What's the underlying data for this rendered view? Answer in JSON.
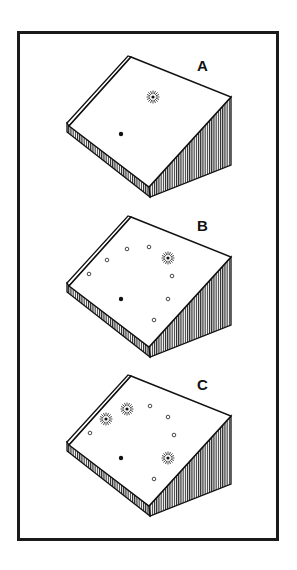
{
  "figure": {
    "frame": {
      "x": 17,
      "y": 31,
      "width": 262,
      "height": 510,
      "stroke": "#1a1a1a"
    },
    "panels": [
      {
        "label": "A",
        "offset_y": 0,
        "stars": [
          [
            153,
            97
          ]
        ],
        "filled_dots": [
          [
            121,
            134
          ]
        ],
        "open_circles": []
      },
      {
        "label": "B",
        "offset_y": 160,
        "stars": [
          [
            168,
            258
          ]
        ],
        "filled_dots": [
          [
            121,
            299
          ]
        ],
        "open_circles": [
          [
            127,
            249
          ],
          [
            149,
            247
          ],
          [
            107,
            260
          ],
          [
            89,
            274
          ],
          [
            172,
            276
          ],
          [
            168,
            299
          ],
          [
            154,
            320
          ]
        ]
      },
      {
        "label": "C",
        "offset_y": 319,
        "stars": [
          [
            127,
            409
          ],
          [
            106,
            419
          ],
          [
            168,
            458
          ]
        ],
        "filled_dots": [
          [
            121,
            458
          ]
        ],
        "open_circles": [
          [
            150,
            406
          ],
          [
            168,
            417
          ],
          [
            90,
            433
          ],
          [
            174,
            435
          ],
          [
            154,
            479
          ]
        ]
      }
    ],
    "legend_semantics": {
      "star-icon": "radiating burst marker",
      "filled-dot": "solid black point",
      "open-circle": "small hollow circle"
    }
  }
}
